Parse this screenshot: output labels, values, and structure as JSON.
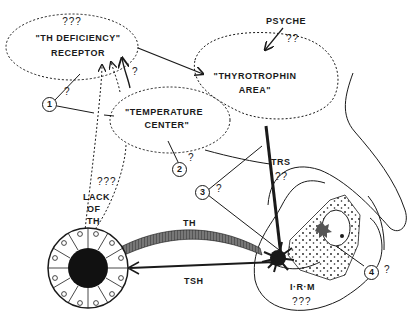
{
  "diagram": {
    "nodes": {
      "receptor": {
        "q": "???",
        "line1": "\"TH DEFICIENCY\"",
        "line2": "RECEPTOR"
      },
      "thyrotrophin": {
        "line1": "\"THYROTROPHIN",
        "line2": "AREA\""
      },
      "temperature": {
        "line1": "\"TEMPERATURE",
        "line2": "CENTER\""
      },
      "psyche": {
        "label": "PSYCHE",
        "q": "??"
      },
      "irm": {
        "label": "I·R·M",
        "q": "???"
      }
    },
    "edges": {
      "th": "TH",
      "tsh": "TSH",
      "trs": "TRS",
      "trs_q": "??",
      "lack_q": "???",
      "lack1": "LACK",
      "lack2": "OF",
      "lack3": "TH",
      "arrow_q": "?"
    },
    "markers": [
      {
        "n": "1",
        "q": "?"
      },
      {
        "n": "2",
        "q": "?"
      },
      {
        "n": "3",
        "q": "?"
      },
      {
        "n": "4",
        "q": "?"
      }
    ],
    "colors": {
      "ink": "#1a1a1a",
      "background": "#ffffff"
    }
  }
}
